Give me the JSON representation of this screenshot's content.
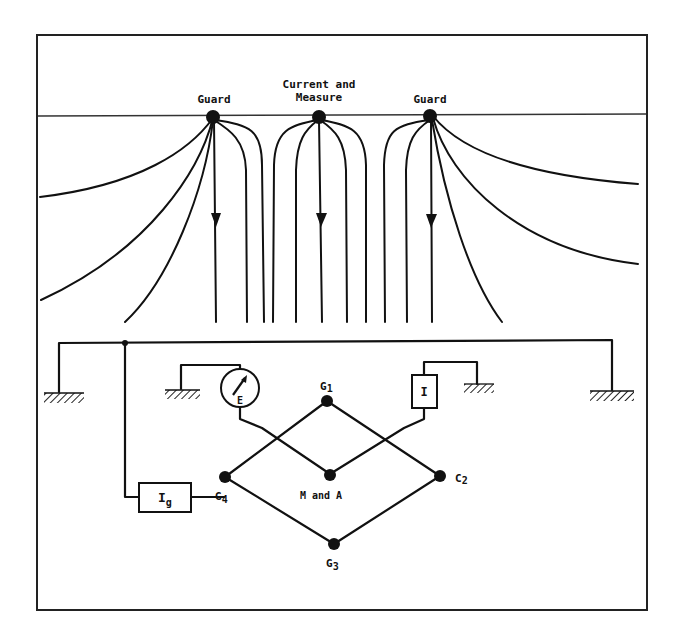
{
  "figure": {
    "top_labels": {
      "left_electrode": "Guard",
      "center_electrode_line1": "Current and",
      "center_electrode_line2": "Measure",
      "right_electrode": "Guard"
    },
    "circuit_labels": {
      "g1": "G1",
      "g2": "C2",
      "g3": "G3",
      "g4": "G4",
      "center_node": "M and A",
      "meter_symbol": "E",
      "current_source": "I",
      "guard_source": "Ig"
    }
  }
}
